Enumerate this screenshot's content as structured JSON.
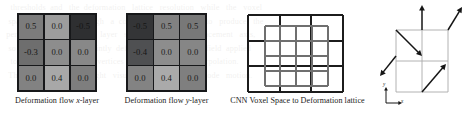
{
  "figure": {
    "background_bleed_lines": [
      "   thresholds  and   the  deformation   lattice   resolution   while   the   voxel",
      "  space   is  mapped   through   a  convolutional   encoder   to   produce   the",
      " per-node   offsets.    Each   layer   stores   a   single   displacement   axis,",
      "  so  the  pair  of  layers  jointly  defines  the  planar  flow  field  applied",
      "   to   the  control   lattice   vertices   before   trilinear   interpolation.",
      "  The   arrows   on   the   right   visualise   the   resulting   node   motion."
    ]
  },
  "panels": [
    {
      "id": "deformation-flow-x",
      "caption_prefix": "Deformation flow ",
      "caption_italic": "x",
      "caption_suffix": "-layer",
      "grid": {
        "rows": 3,
        "cols": 3,
        "cells": [
          {
            "value": "0.5",
            "fill": "#7c7c7c",
            "text_color": "#1a1a1a"
          },
          {
            "value": "0.0",
            "fill": "#9d9d9d",
            "text_color": "#1a1a1a"
          },
          {
            "value": "-0.5",
            "fill": "#2e2f31",
            "text_color": "#141414"
          },
          {
            "value": "-0.3",
            "fill": "#6e6e6e",
            "text_color": "#141414"
          },
          {
            "value": "0.0",
            "fill": "#8d8d8d",
            "text_color": "#1a1a1a"
          },
          {
            "value": "0.0",
            "fill": "#888888",
            "text_color": "#1a1a1a"
          },
          {
            "value": "0.0",
            "fill": "#828282",
            "text_color": "#1a1a1a"
          },
          {
            "value": "0.4",
            "fill": "#a8a8a8",
            "text_color": "#1a1a1a"
          },
          {
            "value": "0.0",
            "fill": "#7e7e7e",
            "text_color": "#1a1a1a"
          }
        ]
      }
    },
    {
      "id": "deformation-flow-y",
      "caption_prefix": "Deformation flow ",
      "caption_italic": "y",
      "caption_suffix": "-layer",
      "grid": {
        "rows": 3,
        "cols": 3,
        "cells": [
          {
            "value": "-0.5",
            "fill": "#343537",
            "text_color": "#151515"
          },
          {
            "value": "0.5",
            "fill": "#818181",
            "text_color": "#1a1a1a"
          },
          {
            "value": "0.5",
            "fill": "#787878",
            "text_color": "#1a1a1a"
          },
          {
            "value": "-0.4",
            "fill": "#4f5052",
            "text_color": "#151515"
          },
          {
            "value": "0.0",
            "fill": "#8d8d8d",
            "text_color": "#1a1a1a"
          },
          {
            "value": "0.0",
            "fill": "#868686",
            "text_color": "#1a1a1a"
          },
          {
            "value": "0.0",
            "fill": "#838383",
            "text_color": "#1a1a1a"
          },
          {
            "value": "0.4",
            "fill": "#aaaaaa",
            "text_color": "#1a1a1a"
          },
          {
            "value": "0.0",
            "fill": "#7f7f7f",
            "text_color": "#1a1a1a"
          }
        ]
      }
    },
    {
      "id": "cnn-voxel-lattice",
      "caption_prefix": "CNN Voxel Space to Deformation lattice",
      "caption_italic": "",
      "caption_suffix": "",
      "lattice": {
        "outer_divisions": 3,
        "outer_color": "#1c1c1c",
        "outer_stroke": 2.1,
        "inner_divisions": 4,
        "inner_color": "#6f6f6f",
        "inner_stroke": 2.0
      }
    },
    {
      "id": "deformation-node-arrows",
      "caption_prefix": "",
      "caption_italic": "",
      "caption_suffix": "",
      "arrows": {
        "grid_divisions": 2,
        "grid_color": "#a9a9a9",
        "arrow_color": "#151515",
        "axis_x_label": "x",
        "axis_y_label": "y",
        "vectors": [
          {
            "name": "top-center-up",
            "from": [
              44,
              26
            ],
            "to": [
              44,
              1
            ]
          },
          {
            "name": "top-right-up-left",
            "from": [
              70,
              26
            ],
            "to": [
              84,
              3
            ]
          },
          {
            "name": "top-left-down-right",
            "from": [
              18,
              26
            ],
            "to": [
              44,
              52
            ]
          },
          {
            "name": "mid-left-down-left",
            "from": [
              18,
              52
            ],
            "to": [
              2,
              72
            ]
          },
          {
            "name": "bottom-center-up-right",
            "from": [
              44,
              88
            ],
            "to": [
              68,
              60
            ]
          }
        ]
      }
    }
  ]
}
